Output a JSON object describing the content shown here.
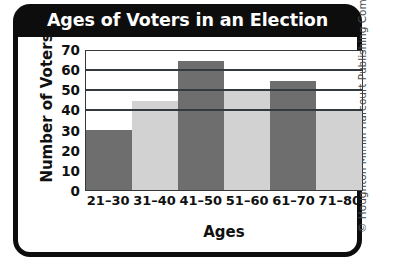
{
  "chart_data": {
    "type": "bar",
    "title": "Ages of Voters in an Election",
    "xlabel": "Ages",
    "ylabel": "Number of Voters",
    "categories": [
      "21–30",
      "31–40",
      "41–50",
      "51–60",
      "61–70",
      "71–80"
    ],
    "values": [
      30,
      45,
      65,
      50,
      55,
      40
    ],
    "ylim": [
      0,
      70
    ],
    "yticks": [
      0,
      10,
      20,
      30,
      40,
      50,
      60,
      70
    ],
    "ytick_labels": [
      "0",
      "10",
      "20",
      "30",
      "40",
      "50",
      "60",
      "70"
    ],
    "gridlines_at": [
      40,
      50,
      60,
      70
    ],
    "grid": true,
    "legend": "none",
    "bar_colors": [
      "#6e6e6e",
      "#d2d2d2",
      "#6e6e6e",
      "#d2d2d2",
      "#6e6e6e",
      "#d2d2d2"
    ],
    "bars": [
      {
        "category": "21–30",
        "value": 30,
        "color": "#6e6e6e"
      },
      {
        "category": "31–40",
        "value": 45,
        "color": "#d2d2d2"
      },
      {
        "category": "41–50",
        "value": 65,
        "color": "#6e6e6e"
      },
      {
        "category": "51–60",
        "value": 50,
        "color": "#d2d2d2"
      },
      {
        "category": "61–70",
        "value": 55,
        "color": "#6e6e6e"
      },
      {
        "category": "71–80",
        "value": 40,
        "color": "#d2d2d2"
      }
    ]
  },
  "frame": {
    "border_color": "#0d0d0d",
    "title_text_color": "#ffffff",
    "panel_color": "#ffffff",
    "axis_color": "#33393d"
  },
  "copyright": {
    "text": "© Houghton Mifflin Harcourt Publishing Company"
  }
}
